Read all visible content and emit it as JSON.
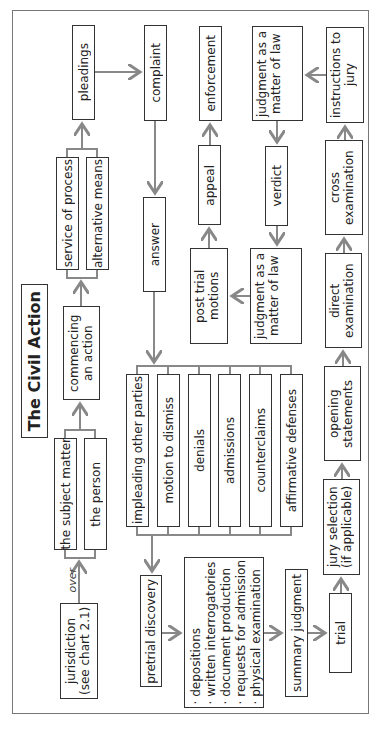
{
  "title": "The Civil Action",
  "nodes": {
    "jurisdiction": "jurisdiction (see chart 2.1)",
    "over_label": "over",
    "subject_matter": "the subject matter",
    "the_person": "the person",
    "commencing": "commencing an action",
    "service_of_process": "service of process",
    "alternative_means": "alternative means",
    "pleadings": "pleadings",
    "complaint": "complaint",
    "answer": "answer",
    "responses": [
      "impleading other parties",
      "motion to dismiss",
      "denials",
      "admissions",
      "counterclaims",
      "affirmative defenses"
    ],
    "pretrial_discovery": "pretrial discovery",
    "discovery_methods": [
      "· depositions",
      "· written interrogatories",
      "· document production",
      "· requests for admission",
      "· physical examination"
    ],
    "summary_judgment": "summary judgment",
    "trial": "trial",
    "jury_selection": "jury selection (if applicable)",
    "opening_statements": "opening statements",
    "direct_examination": "direct examination",
    "cross_examination": "cross examination",
    "instructions_to_jury": "instructions to jury",
    "judgment_top": "judgment as a matter of law",
    "verdict": "verdict",
    "judgment_mid": "judgment as a matter of law",
    "post_trial_motions": "post trial motions",
    "appeal": "appeal",
    "enforcement": "enforcement"
  },
  "colors": {
    "box_border": "#333333",
    "connector": "#888888",
    "frame": "#777777"
  }
}
